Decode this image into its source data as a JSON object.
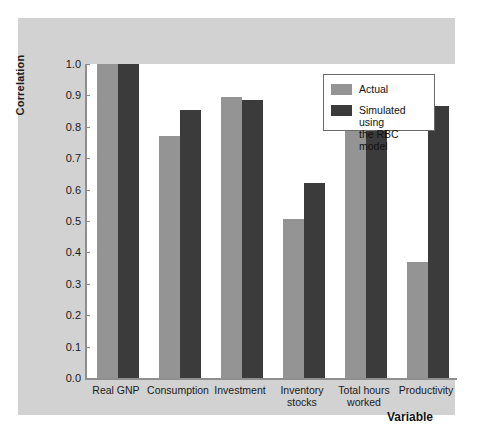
{
  "chart_data": {
    "type": "bar",
    "title": "",
    "xlabel": "Variable",
    "ylabel": "Correlation",
    "ylim": [
      0.0,
      1.0
    ],
    "grid": false,
    "legend_position": "top-right",
    "categories": [
      "Real GNP",
      "Consumption",
      "Investment",
      "Inventory\nstocks",
      "Total hours\nworked",
      "Productivity"
    ],
    "ytick_labels": [
      "1.0",
      "0.9",
      "0.8",
      "0.7",
      "0.6",
      "0.5",
      "0.4",
      "0.3",
      "0.2",
      "0.1",
      "0.0"
    ],
    "ytick_values": [
      1.0,
      0.9,
      0.8,
      0.7,
      0.6,
      0.5,
      0.4,
      0.3,
      0.2,
      0.1,
      0.0
    ],
    "series": [
      {
        "name": "Actual",
        "color": "#949494",
        "values": [
          1.0,
          0.77,
          0.895,
          0.505,
          0.857,
          0.37
        ]
      },
      {
        "name": "Simulated using\nthe RBC model",
        "color": "#3b3b3b",
        "values": [
          1.0,
          0.855,
          0.885,
          0.62,
          0.95,
          0.865
        ]
      }
    ]
  },
  "legend": {
    "items": [
      {
        "label": "Actual",
        "swatch": "#949494"
      },
      {
        "label": "Simulated using\nthe RBC model",
        "swatch": "#3b3b3b"
      }
    ]
  },
  "colors": {
    "figure_background": "#ffffff",
    "panel_background": "#d2d2d2",
    "plot_background": "#ffffff",
    "axis_line": "#8e8e8e",
    "actual_bar": "#949494",
    "simulated_bar": "#3b3b3b",
    "text": "#1a1a1a"
  }
}
